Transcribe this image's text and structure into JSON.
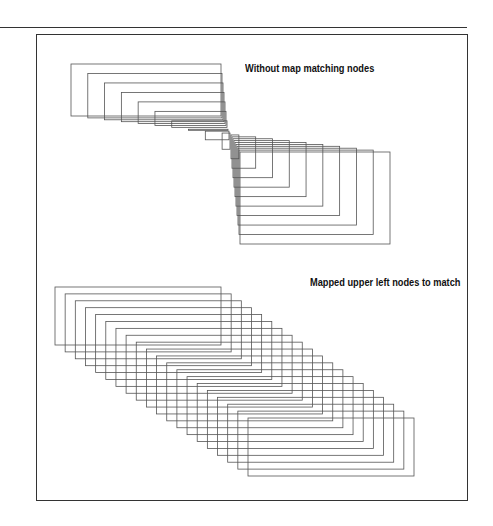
{
  "figure": {
    "panels": [
      {
        "id": "without-map",
        "caption": "Without map matching nodes",
        "description": "Rectangles interpolated without node matching collapse toward a point then expand",
        "rectangle_count": 20,
        "behavior": "collapse-then-expand"
      },
      {
        "id": "mapped",
        "caption": "Mapped upper left nodes to match",
        "description": "Rectangles interpolated with upper-left nodes matched keep constant size and shift diagonally",
        "rectangle_count": 20,
        "behavior": "constant-size-translate"
      }
    ],
    "colors": {
      "stroke": "#555555",
      "frame": "#333333",
      "background": "#ffffff"
    }
  }
}
